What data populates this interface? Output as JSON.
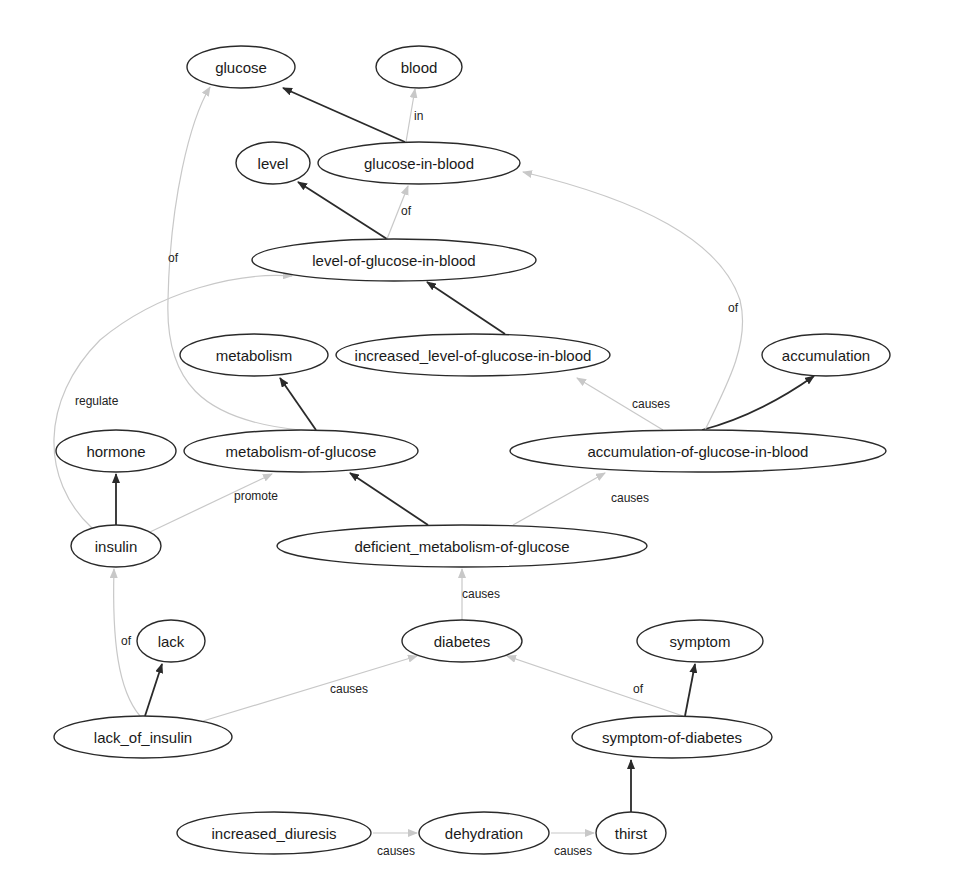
{
  "diagram": {
    "type": "concept-graph",
    "colors": {
      "node_stroke": "#2a2a2a",
      "strong_edge": "#2a2a2a",
      "weak_edge": "#c8c8c8",
      "background": "#ffffff"
    },
    "nodes": [
      {
        "id": "glucose",
        "label": "glucose",
        "cx": 241,
        "cy": 67,
        "rx": 54,
        "ry": 21
      },
      {
        "id": "blood",
        "label": "blood",
        "cx": 419,
        "cy": 67,
        "rx": 43,
        "ry": 21
      },
      {
        "id": "level",
        "label": "level",
        "cx": 273,
        "cy": 163,
        "rx": 37,
        "ry": 21
      },
      {
        "id": "glucose-in-blood",
        "label": "glucose-in-blood",
        "cx": 419,
        "cy": 163,
        "rx": 101,
        "ry": 21
      },
      {
        "id": "level-of-glucose-in-blood",
        "label": "level-of-glucose-in-blood",
        "cx": 394,
        "cy": 260,
        "rx": 142,
        "ry": 21
      },
      {
        "id": "metabolism",
        "label": "metabolism",
        "cx": 254,
        "cy": 355,
        "rx": 74,
        "ry": 21
      },
      {
        "id": "increased_level-of-glucose-in-blood",
        "label": "increased_level-of-glucose-in-blood",
        "cx": 473,
        "cy": 355,
        "rx": 137,
        "ry": 21
      },
      {
        "id": "accumulation",
        "label": "accumulation",
        "cx": 826,
        "cy": 355,
        "rx": 64,
        "ry": 21
      },
      {
        "id": "hormone",
        "label": "hormone",
        "cx": 116,
        "cy": 451,
        "rx": 60,
        "ry": 21
      },
      {
        "id": "metabolism-of-glucose",
        "label": "metabolism-of-glucose",
        "cx": 301,
        "cy": 451,
        "rx": 117,
        "ry": 21
      },
      {
        "id": "accumulation-of-glucose-in-blood",
        "label": "accumulation-of-glucose-in-blood",
        "cx": 698,
        "cy": 451,
        "rx": 188,
        "ry": 21
      },
      {
        "id": "insulin",
        "label": "insulin",
        "cx": 116,
        "cy": 546,
        "rx": 45,
        "ry": 21
      },
      {
        "id": "deficient_metabolism-of-glucose",
        "label": "deficient_metabolism-of-glucose",
        "cx": 462,
        "cy": 546,
        "rx": 185,
        "ry": 21
      },
      {
        "id": "lack",
        "label": "lack",
        "cx": 171,
        "cy": 641,
        "rx": 34,
        "ry": 21
      },
      {
        "id": "diabetes",
        "label": "diabetes",
        "cx": 462,
        "cy": 641,
        "rx": 60,
        "ry": 21
      },
      {
        "id": "symptom",
        "label": "symptom",
        "cx": 700,
        "cy": 641,
        "rx": 63,
        "ry": 21
      },
      {
        "id": "lack_of_insulin",
        "label": "lack_of_insulin",
        "cx": 143,
        "cy": 737,
        "rx": 89,
        "ry": 21
      },
      {
        "id": "symptom-of-diabetes",
        "label": "symptom-of-diabetes",
        "cx": 672,
        "cy": 737,
        "rx": 100,
        "ry": 21
      },
      {
        "id": "increased_diuresis",
        "label": "increased_diuresis",
        "cx": 274,
        "cy": 833,
        "rx": 97,
        "ry": 21
      },
      {
        "id": "dehydration",
        "label": "dehydration",
        "cx": 484,
        "cy": 833,
        "rx": 65,
        "ry": 21
      },
      {
        "id": "thirst",
        "label": "thirst",
        "cx": 631,
        "cy": 833,
        "rx": 35,
        "ry": 21
      }
    ],
    "edges": [
      {
        "from": "glucose-in-blood",
        "to": "glucose",
        "label": "",
        "style": "strong",
        "d": "M 405 142 L 283 88",
        "lx": 0,
        "ly": 0
      },
      {
        "from": "glucose-in-blood",
        "to": "blood",
        "label": "in",
        "style": "weak",
        "d": "M 406 142 L 415 89",
        "lx": 414,
        "ly": 120
      },
      {
        "from": "level-of-glucose-in-blood",
        "to": "level",
        "label": "",
        "style": "strong",
        "d": "M 387 239 L 298 182",
        "lx": 0,
        "ly": 0
      },
      {
        "from": "level-of-glucose-in-blood",
        "to": "glucose-in-blood",
        "label": "of",
        "style": "weak",
        "d": "M 387 239 L 408 186",
        "lx": 401,
        "ly": 215
      },
      {
        "from": "increased_level-of-glucose-in-blood",
        "to": "level-of-glucose-in-blood",
        "label": "",
        "style": "strong",
        "d": "M 505 334 L 427 282",
        "lx": 0,
        "ly": 0
      },
      {
        "from": "metabolism-of-glucose",
        "to": "metabolism",
        "label": "",
        "style": "strong",
        "d": "M 316 430 L 280 378",
        "lx": 0,
        "ly": 0
      },
      {
        "from": "metabolism-of-glucose",
        "to": "glucose",
        "label": "of",
        "style": "weak",
        "d": "M 300 430 C 200 420, 165 380, 168 300 C 170 200, 190 120, 210 87",
        "lx": 168,
        "ly": 262
      },
      {
        "from": "accumulation-of-glucose-in-blood",
        "to": "accumulation",
        "label": "",
        "style": "strong",
        "d": "M 702 430 C 740 420, 780 400, 814 376",
        "lx": 0,
        "ly": 0
      },
      {
        "from": "accumulation-of-glucose-in-blood",
        "to": "increased_level-of-glucose-in-blood",
        "label": "causes",
        "style": "weak",
        "d": "M 663 430 L 577 378",
        "lx": 632,
        "ly": 408
      },
      {
        "from": "accumulation-of-glucose-in-blood",
        "to": "glucose-in-blood",
        "label": "of",
        "style": "weak",
        "d": "M 705 430 C 730 380, 750 340, 740 300 C 720 240, 640 200, 523 172",
        "lx": 728,
        "ly": 312
      },
      {
        "from": "insulin",
        "to": "hormone",
        "label": "",
        "style": "strong",
        "d": "M 116 525 L 116 474",
        "lx": 0,
        "ly": 0
      },
      {
        "from": "insulin",
        "to": "metabolism-of-glucose",
        "label": "promote",
        "style": "weak",
        "d": "M 150 532 L 272 474",
        "lx": 234,
        "ly": 500
      },
      {
        "from": "insulin",
        "to": "level-of-glucose-in-blood",
        "label": "regulate",
        "style": "weak",
        "d": "M 92 528 C 40 480, 40 400, 100 340 C 160 290, 240 272, 292 276",
        "lx": 75,
        "ly": 405
      },
      {
        "from": "deficient_metabolism-of-glucose",
        "to": "metabolism-of-glucose",
        "label": "",
        "style": "strong",
        "d": "M 428 525 L 350 473",
        "lx": 0,
        "ly": 0
      },
      {
        "from": "deficient_metabolism-of-glucose",
        "to": "accumulation-of-glucose-in-blood",
        "label": "causes",
        "style": "weak",
        "d": "M 513 525 L 605 473",
        "lx": 611,
        "ly": 502
      },
      {
        "from": "diabetes",
        "to": "deficient_metabolism-of-glucose",
        "label": "causes",
        "style": "weak",
        "d": "M 462 620 L 462 569",
        "lx": 462,
        "ly": 598
      },
      {
        "from": "lack_of_insulin",
        "to": "lack",
        "label": "",
        "style": "strong",
        "d": "M 145 716 L 162 664",
        "lx": 0,
        "ly": 0
      },
      {
        "from": "lack_of_insulin",
        "to": "insulin",
        "label": "of",
        "style": "weak",
        "d": "M 140 716 C 118 690, 112 640, 114 569",
        "lx": 121,
        "ly": 645
      },
      {
        "from": "lack_of_insulin",
        "to": "diabetes",
        "label": "causes",
        "style": "weak",
        "d": "M 203 721 L 417 656",
        "lx": 330,
        "ly": 693
      },
      {
        "from": "symptom-of-diabetes",
        "to": "symptom",
        "label": "",
        "style": "strong",
        "d": "M 685 716 L 695 664",
        "lx": 0,
        "ly": 0
      },
      {
        "from": "symptom-of-diabetes",
        "to": "diabetes",
        "label": "of",
        "style": "weak",
        "d": "M 683 716 L 507 656",
        "lx": 633,
        "ly": 693
      },
      {
        "from": "thirst",
        "to": "symptom-of-diabetes",
        "label": "",
        "style": "strong",
        "d": "M 631 812 L 631 760",
        "lx": 0,
        "ly": 0
      },
      {
        "from": "increased_diuresis",
        "to": "dehydration",
        "label": "causes",
        "style": "weak",
        "d": "M 373 833 L 417 833",
        "lx": 377,
        "ly": 855
      },
      {
        "from": "dehydration",
        "to": "thirst",
        "label": "causes",
        "style": "weak",
        "d": "M 551 833 L 594 833",
        "lx": 554,
        "ly": 855
      }
    ]
  }
}
